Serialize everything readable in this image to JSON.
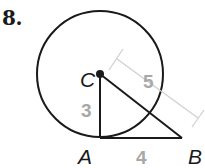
{
  "problem": {
    "number": "8."
  },
  "figure": {
    "points": {
      "C": {
        "label": "C"
      },
      "A": {
        "label": "A"
      },
      "B": {
        "label": "B"
      }
    },
    "lengths": {
      "CA": "3",
      "AB": "4",
      "CB": "5"
    },
    "colors": {
      "stroke": "#1a1a1a",
      "length_label": "#a8a8a8",
      "dimension_line": "#d0d0d0"
    }
  }
}
